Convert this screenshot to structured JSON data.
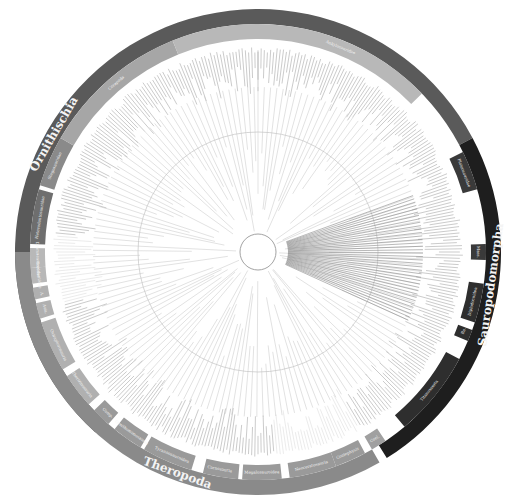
{
  "figure": {
    "type": "circular-phylogeny",
    "center": [
      258,
      252
    ],
    "outer_ring": {
      "r_in": 228,
      "r_out": 243
    },
    "inner_ring": {
      "r_in": 213,
      "r_out": 228
    },
    "tree_radius": 205,
    "inner_circle_radius": 120
  },
  "major_clades": [
    {
      "name": "Ornithischia",
      "start": 222,
      "end": 62,
      "color": "#5a5a5a",
      "label_angle": 300,
      "label_size": 12
    },
    {
      "name": "Sauropodomorpha",
      "start": 62,
      "end": 148,
      "color": "#1e1e1e",
      "label_angle": 98,
      "label_size": 12
    },
    {
      "name": "Theropoda",
      "start": 150,
      "end": 270,
      "color": "#8a8a8a",
      "label_angle": 200,
      "label_size": 12
    }
  ],
  "sub_clades": [
    {
      "name": "Heterodontosauridae",
      "start": 272,
      "end": 286,
      "color": "#6e6e6e",
      "label_angle": 279
    },
    {
      "name": "Stegosauridae",
      "start": 287,
      "end": 300,
      "color": "#8a8a8a",
      "label_angle": 293
    },
    {
      "name": "Cerapoda",
      "start": 300,
      "end": 338,
      "color": "#a6a6a6",
      "label_angle": 320
    },
    {
      "name": "Ankylosauridae",
      "start": 338,
      "end": 46,
      "color": "#b8b8b8",
      "label_angle": 22
    },
    {
      "name": "Plateosauridae",
      "start": 64,
      "end": 74,
      "color": "#3a3a3a",
      "label_angle": 69
    },
    {
      "name": "Mass.",
      "start": 88,
      "end": 92,
      "color": "#3a3a3a",
      "label_angle": 90
    },
    {
      "name": "Diplodocoidea",
      "start": 98,
      "end": 108,
      "color": "#2e2e2e",
      "label_angle": 103
    },
    {
      "name": "Re.",
      "start": 110,
      "end": 113,
      "color": "#2e2e2e",
      "label_angle": 111
    },
    {
      "name": "Titanosauria",
      "start": 118,
      "end": 140,
      "color": "#2e2e2e",
      "label_angle": 129
    },
    {
      "name": "Coel.",
      "start": 146,
      "end": 150,
      "color": "#a0a0a0",
      "label_angle": 148
    },
    {
      "name": "Coelophysis",
      "start": 152,
      "end": 160,
      "color": "#9a9a9a",
      "label_angle": 156
    },
    {
      "name": "Neoceratosauria",
      "start": 160,
      "end": 172,
      "color": "#9a9a9a",
      "label_angle": 166
    },
    {
      "name": "Megalosauroidea",
      "start": 174,
      "end": 184,
      "color": "#9a9a9a",
      "label_angle": 179
    },
    {
      "name": "Carnosauria",
      "start": 185,
      "end": 194,
      "color": "#9a9a9a",
      "label_angle": 190
    },
    {
      "name": "Tyrannosauroidea",
      "start": 197,
      "end": 210,
      "color": "#9a9a9a",
      "label_angle": 203
    },
    {
      "name": "Ornithomimosauria",
      "start": 211,
      "end": 219,
      "color": "#9a9a9a",
      "label_angle": 215
    },
    {
      "name": "Comp.",
      "start": 221,
      "end": 226,
      "color": "#9a9a9a",
      "label_angle": 223
    },
    {
      "name": "Therizinosauria",
      "start": 228,
      "end": 237,
      "color": "#b0b0b0",
      "label_angle": 233
    },
    {
      "name": "Oviraptorosauria",
      "start": 239,
      "end": 252,
      "color": "#b0b0b0",
      "label_angle": 245
    },
    {
      "name": "Avia.",
      "start": 253,
      "end": 257,
      "color": "#b0b0b0",
      "label_angle": 255
    },
    {
      "name": "A.",
      "start": 258,
      "end": 261,
      "color": "#b0b0b0",
      "label_angle": 259
    },
    {
      "name": "Troodontidae",
      "start": 262,
      "end": 266,
      "color": "#b8b8b8",
      "label_angle": 264
    },
    {
      "name": "Dromaeosauridae",
      "start": 266,
      "end": 271,
      "color": "#b8b8b8",
      "label_angle": 268
    }
  ],
  "legend_labels": [
    "Ornithischia",
    "Cerapoda",
    "Ankylosauridae",
    "Heterodontosauridae",
    "Stegosauridae",
    "Sauropodomorpha",
    "Plateosauridae",
    "Diplodocoidea",
    "Titanosauria",
    "Theropoda",
    "Ornithomimosauria",
    "Tyrannosauroidea",
    "Carnosauria",
    "Megalosauroidea",
    "Neoceratosauria",
    "Coelophysis"
  ],
  "colors": {
    "background": "#ffffff",
    "tree_lines": "#9a9a9a",
    "tip_text": "#8c8c8c",
    "label_text": "#f2f2f2"
  }
}
